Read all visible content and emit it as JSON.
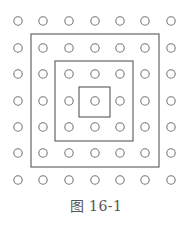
{
  "figure": {
    "caption": "图 16-1",
    "grid": {
      "rows": 7,
      "cols": 7,
      "xs": [
        18,
        43,
        69,
        95,
        120,
        145,
        171
      ],
      "ys": [
        21,
        48,
        74,
        101,
        127,
        153,
        180
      ],
      "radius": 4.2,
      "stroke": "#777777"
    },
    "squares": [
      {
        "name": "outer-square",
        "x": 31,
        "y": 34,
        "w": 128,
        "h": 133
      },
      {
        "name": "middle-square",
        "x": 55,
        "y": 61,
        "w": 78,
        "h": 80
      },
      {
        "name": "inner-square",
        "x": 79,
        "y": 87,
        "w": 31,
        "h": 30
      }
    ],
    "line_color": "#666666"
  }
}
